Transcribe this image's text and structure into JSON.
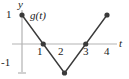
{
  "figure": {
    "axes": {
      "x_axis_label": "t",
      "y_axis_label": "y",
      "axis_color": "#b3b3b3",
      "axis_width": 1.2,
      "y_axis_x_px": 22,
      "x_axis_y_px": 44,
      "y_axis_top_px": 10,
      "y_axis_bottom_px": 72,
      "x_axis_left_px": 12,
      "x_axis_right_px": 117
    },
    "curve": {
      "label": "g(t)",
      "color": "#3a3a3a",
      "width": 1.4,
      "marker_color": "#3a3a3a",
      "marker_radius": 2.6
    },
    "tick_labels": {
      "y_positive": "1",
      "y_negative": "-1",
      "x": [
        "1",
        "2",
        "3",
        "4"
      ]
    },
    "y_tick_marks": [
      {
        "name": "y-tick-neg1",
        "value": -1
      }
    ]
  },
  "chart_data": {
    "type": "line",
    "title": "",
    "subtitle": "",
    "xlabel": "t",
    "ylabel": "y",
    "xlim": [
      0,
      4.4
    ],
    "ylim": [
      -1.4,
      1.4
    ],
    "grid": false,
    "legend": null,
    "annotations": [
      {
        "text": "g(t)",
        "x": 0.45,
        "y": 1.05
      }
    ],
    "xticks": [
      1,
      2,
      3,
      4
    ],
    "xtick_labels": [
      "1",
      "2",
      "3",
      "4"
    ],
    "yticks": [
      -1,
      1
    ],
    "ytick_labels": [
      "-1",
      "1"
    ],
    "series": [
      {
        "name": "g(t)",
        "markers": true,
        "x": [
          0,
          1,
          2,
          3,
          4
        ],
        "y": [
          1,
          0,
          -1,
          0,
          1
        ]
      }
    ]
  }
}
